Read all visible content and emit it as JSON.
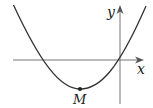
{
  "diagram": {
    "type": "parabola-graph",
    "axes": {
      "x_label": "x",
      "y_label": "y",
      "origin_px": [
        120,
        60
      ]
    },
    "curve": {
      "description": "upward-opening parabola passing through the origin, with a second x-intercept to the left of the origin",
      "roots_px": [
        39,
        120
      ],
      "vertex_px": [
        80,
        89
      ]
    },
    "points": [
      {
        "label": "M",
        "role": "vertex",
        "px": [
          80,
          89
        ]
      }
    ],
    "colors": {
      "curve": "#333333",
      "axes": "#777777",
      "text": "#222222"
    }
  }
}
